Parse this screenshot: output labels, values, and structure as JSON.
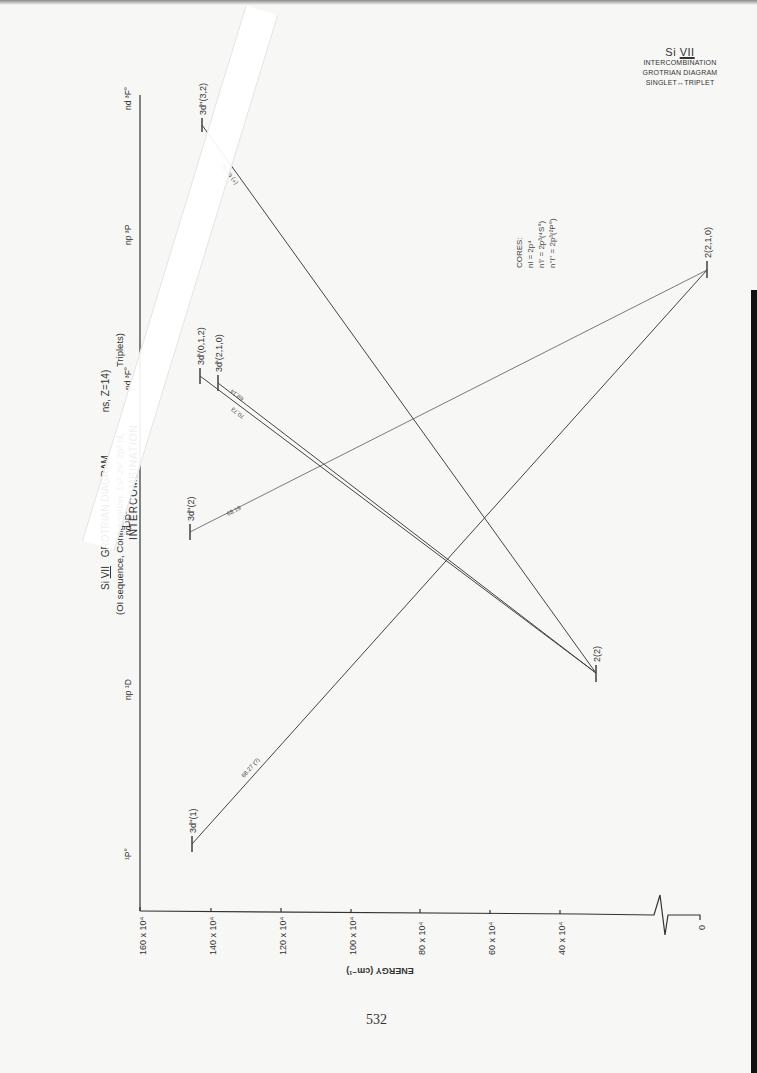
{
  "corner_title": {
    "ion": "Si",
    "ion_stage": "VII",
    "line1": "INTERCOMBINATION",
    "line2": "GROTRIAN DIAGRAM",
    "line3": "SINGLET↔TRIPLET"
  },
  "main_title": {
    "line1": "Si VII  GROTRIAN DIAGRAM   ...ns, Z=14)",
    "line1_ion": "Si",
    "line1_stage": "VII",
    "line1_text": "GROTRIAN DIAGRAM",
    "line1_tail": "ns, Z=14)",
    "line2": "(OI sequence, Configuration: 1s² 2s² 2p³ nl,",
    "line2_tail": "Triplets)",
    "line3": "INTERCOMBINATION"
  },
  "cores": {
    "heading": "CORES:",
    "items": [
      "nl = 2p⁴",
      "n'l' = 2p³(⁴S°)",
      "n''l'' = 2p³(²P°)"
    ]
  },
  "axis": {
    "label": "ENERGY (cm⁻¹)",
    "ticks": [
      "160 x 10⁴",
      "140 x 10⁴",
      "120 x 10⁴",
      "100 x 10⁴",
      "80 x 10⁴",
      "60 x 10⁴",
      "40 x 10⁴",
      "0"
    ]
  },
  "columns": [
    {
      "label": "¹P°"
    },
    {
      "label": "np ¹D"
    },
    {
      "label": "nd ¹D°"
    },
    {
      "label": "nd ³F°"
    },
    {
      "label": "np ³P"
    },
    {
      "label": "nd ³F°"
    }
  ],
  "levels": [
    {
      "id": "3d1",
      "label": "3d''(1)"
    },
    {
      "id": "3d2",
      "label": "3d''(2)"
    },
    {
      "id": "3d012",
      "label": "3d'(0,1,2)"
    },
    {
      "id": "3d210",
      "label": "3d'(2,1,0)"
    },
    {
      "id": "3d32",
      "label": "3d''(3,2)"
    },
    {
      "id": "g2",
      "label": "2(2)"
    },
    {
      "id": "g210",
      "label": "2(2,1,0)"
    }
  ],
  "transitions": [
    {
      "from": "3d''(1)",
      "to": "2(2,1,0)",
      "label": "68.27 (?)"
    },
    {
      "from": "3d''(2)",
      "to": "2(2,1,0)",
      "label": "68.19"
    },
    {
      "from": "3d'(0,1,2)",
      "to": "2(2)",
      "label": "70.73"
    },
    {
      "from": "3d'(2,1,0)",
      "to": "2(2)",
      "label": "69.14"
    },
    {
      "from": "3d''(3,2)",
      "to": "2(2)",
      "label": "(+) 69.01"
    }
  ],
  "page_number": "532"
}
